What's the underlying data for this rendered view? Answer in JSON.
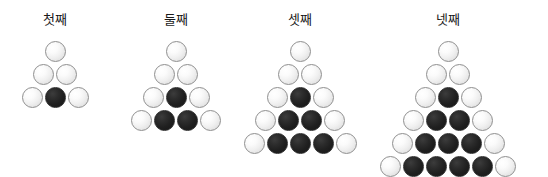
{
  "canvas": {
    "width": 548,
    "height": 177,
    "background": "#ffffff"
  },
  "palette": {
    "white_stone_fill": "#f0f0f0",
    "white_stone_border": "#8f8f8f",
    "black_stone_fill": "#1f1f1f",
    "black_stone_border": "#2a2a2a",
    "label_color": "#1a1a1a"
  },
  "diagram": {
    "stone_diameter_px": 21,
    "row_pitch_px": 23,
    "column_pitch_px": 23,
    "figures": [
      {
        "label": "첫째",
        "index": 1,
        "apex_x": 55,
        "label_y": 12,
        "bottom_row_y": 87,
        "rows": 3,
        "white_count": 5,
        "black_count": 1,
        "total_count": 6,
        "grid": [
          [
            "white"
          ],
          [
            "white",
            "white"
          ],
          [
            "white",
            "black",
            "white"
          ]
        ]
      },
      {
        "label": "둘째",
        "index": 2,
        "apex_x": 176,
        "label_y": 12,
        "bottom_row_y": 110,
        "rows": 4,
        "white_count": 7,
        "black_count": 3,
        "total_count": 10,
        "grid": [
          [
            "white"
          ],
          [
            "white",
            "white"
          ],
          [
            "white",
            "black",
            "white"
          ],
          [
            "white",
            "black",
            "black",
            "white"
          ]
        ]
      },
      {
        "label": "셋째",
        "index": 3,
        "apex_x": 300,
        "label_y": 12,
        "bottom_row_y": 133,
        "rows": 5,
        "white_count": 9,
        "black_count": 6,
        "total_count": 15,
        "grid": [
          [
            "white"
          ],
          [
            "white",
            "white"
          ],
          [
            "white",
            "black",
            "white"
          ],
          [
            "white",
            "black",
            "black",
            "white"
          ],
          [
            "white",
            "black",
            "black",
            "black",
            "white"
          ]
        ]
      },
      {
        "label": "넷째",
        "index": 4,
        "apex_x": 448,
        "label_y": 12,
        "bottom_row_y": 156,
        "rows": 6,
        "white_count": 11,
        "black_count": 10,
        "total_count": 21,
        "grid": [
          [
            "white"
          ],
          [
            "white",
            "white"
          ],
          [
            "white",
            "black",
            "white"
          ],
          [
            "white",
            "black",
            "black",
            "white"
          ],
          [
            "white",
            "black",
            "black",
            "black",
            "white"
          ],
          [
            "white",
            "black",
            "black",
            "black",
            "black",
            "white"
          ]
        ]
      }
    ]
  }
}
